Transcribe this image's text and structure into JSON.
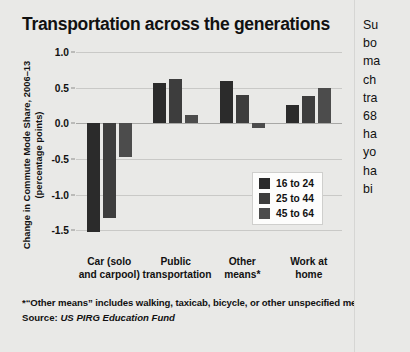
{
  "title": "Transportation across the generations",
  "axis": {
    "ylabel_line1": "Change in Commute Mode Share, 2006–13",
    "ylabel_line2": "(percentage points)"
  },
  "legend": {
    "items": [
      {
        "label": "16 to 24",
        "color": "#2b2b2b"
      },
      {
        "label": "25 to 44",
        "color": "#3d3d3d"
      },
      {
        "label": "45 to 64",
        "color": "#4c4c4c"
      }
    ]
  },
  "footnote": "*“Other means” includes walking, taxicab, bicycle, or other unspecified means.",
  "source": {
    "prefix": "Source: ",
    "value": "US PIRG Education Fund"
  },
  "sidecolumn": {
    "lines": [
      "Su",
      "bo",
      "ma",
      "ch",
      "tra",
      "68",
      "ha",
      "yo",
      "ha",
      "bi"
    ]
  },
  "chart_data": {
    "type": "bar",
    "title": "Transportation across the generations",
    "xlabel": "",
    "ylabel": "Change in Commute Mode Share, 2006–13 (percentage points)",
    "ylim": [
      -1.75,
      1.0
    ],
    "yticks": [
      1.0,
      0.5,
      0.0,
      -0.5,
      -1.0,
      -1.5
    ],
    "ytick_labels": [
      "1.0",
      "0.5",
      "0.0",
      "-0.5",
      "-1.0",
      "-1.5"
    ],
    "grid": true,
    "legend_position": "inside-bottom-right",
    "categories": [
      "Car (solo and carpool)",
      "Public transportation",
      "Other means*",
      "Work at home"
    ],
    "category_lines": [
      [
        "Car (solo",
        "and carpool)"
      ],
      [
        "Public",
        "transportation"
      ],
      [
        "Other",
        "means*"
      ],
      [
        "Work at",
        "home"
      ]
    ],
    "series": [
      {
        "name": "16 to 24",
        "color": "#2b2b2b",
        "values": [
          -1.52,
          0.57,
          0.59,
          0.26
        ]
      },
      {
        "name": "25 to 44",
        "color": "#3d3d3d",
        "values": [
          -1.33,
          0.62,
          0.4,
          0.38
        ]
      },
      {
        "name": "45 to 64",
        "color": "#4c4c4c",
        "values": [
          -0.48,
          0.11,
          -0.07,
          0.5
        ]
      }
    ]
  }
}
